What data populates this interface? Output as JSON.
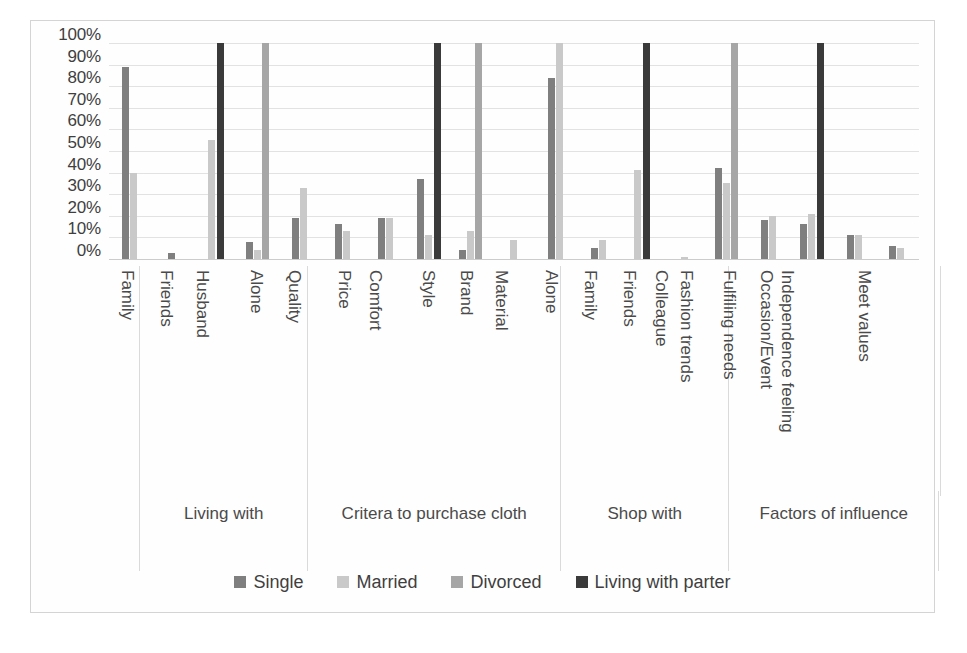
{
  "chart_data": {
    "type": "bar",
    "title": "",
    "xlabel": "",
    "ylabel": "",
    "ylim": [
      0,
      100
    ],
    "grid": true,
    "legend_position": "bottom",
    "y_ticks": [
      "100%",
      "90%",
      "80%",
      "70%",
      "60%",
      "50%",
      "40%",
      "30%",
      "20%",
      "10%",
      "0%"
    ],
    "y_tick_values": [
      100,
      90,
      80,
      70,
      60,
      50,
      40,
      30,
      20,
      10,
      0
    ],
    "series_names": [
      "Single",
      "Married",
      "Divorced",
      "Living with parter"
    ],
    "series_colors": [
      "#7f7f7f",
      "#c9c9c9",
      "#a6a6a6",
      "#3a3a3a"
    ],
    "groups": [
      {
        "title": "Living with",
        "categories": [
          "Family",
          "Friends",
          "Husband",
          "Alone"
        ],
        "series": [
          {
            "name": "Single",
            "values": [
              89,
              3,
              0,
              8
            ]
          },
          {
            "name": "Married",
            "values": [
              40,
              0,
              55,
              4
            ]
          },
          {
            "name": "Divorced",
            "values": [
              0,
              0,
              0,
              100
            ]
          },
          {
            "name": "Living with parter",
            "values": [
              0,
              0,
              100,
              0
            ]
          }
        ]
      },
      {
        "title": "Critera to purchase cloth",
        "categories": [
          "Quality",
          "Price",
          "Comfort",
          "Style",
          "Brand",
          "Material"
        ],
        "series": [
          {
            "name": "Single",
            "values": [
              19,
              16,
              19,
              37,
              4,
              0
            ]
          },
          {
            "name": "Married",
            "values": [
              33,
              13,
              19,
              11,
              13,
              9
            ]
          },
          {
            "name": "Divorced",
            "values": [
              0,
              0,
              0,
              0,
              100,
              0
            ]
          },
          {
            "name": "Living with parter",
            "values": [
              0,
              0,
              0,
              100,
              0,
              0
            ]
          }
        ]
      },
      {
        "title": "Shop with",
        "categories": [
          "Alone",
          "Family",
          "Friends",
          "Colleague"
        ],
        "series": [
          {
            "name": "Single",
            "values": [
              84,
              5,
              0,
              0
            ]
          },
          {
            "name": "Married",
            "values": [
              100,
              9,
              41,
              1
            ]
          },
          {
            "name": "Divorced",
            "values": [
              0,
              0,
              0,
              0
            ]
          },
          {
            "name": "Living with parter",
            "values": [
              0,
              0,
              100,
              0
            ]
          }
        ]
      },
      {
        "title": "Factors of influence",
        "categories": [
          "Fashion trends",
          "Fulfiling needs",
          "Occasion/Event",
          "Independence feeling",
          "Meet values"
        ],
        "series": [
          {
            "name": "Single",
            "values": [
              42,
              18,
              16,
              11,
              6
            ]
          },
          {
            "name": "Married",
            "values": [
              35,
              20,
              21,
              11,
              5
            ]
          },
          {
            "name": "Divorced",
            "values": [
              100,
              0,
              0,
              0,
              0
            ]
          },
          {
            "name": "Living with parter",
            "values": [
              0,
              0,
              100,
              0,
              0
            ]
          }
        ]
      }
    ]
  }
}
